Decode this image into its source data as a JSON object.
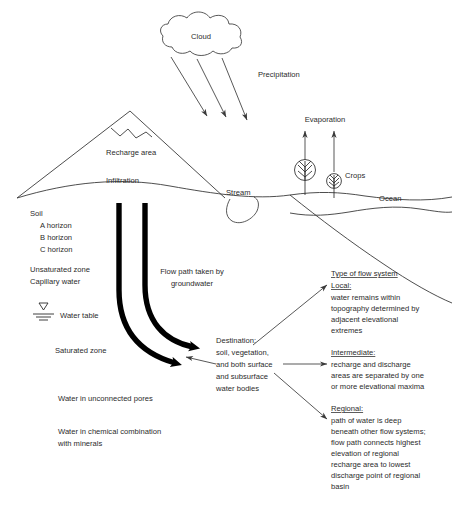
{
  "diagram": {
    "background_color": "#ffffff",
    "ink_color": "#2b2b2b",
    "flow_arrow_color": "#000000"
  },
  "labels": {
    "cloud": "Cloud",
    "precipitation": "Precipitation",
    "evaporation": "Evaporation",
    "recharge_area": "Recharge area",
    "infiltration": "Infiltration",
    "stream": "Stream",
    "crops": "Crops",
    "ocean": "Ocean",
    "water_table": "Water table",
    "saturated_zone": "Saturated zone",
    "unsaturated_zone": "Unsaturated zone",
    "capillary_water": "Capillary water",
    "soil": "Soil",
    "a_horizon": "A horizon",
    "b_horizon": "B horizon",
    "c_horizon": "C horizon",
    "unconnected_pores": "Water in unconnected pores",
    "chemical_combination_1": "Water in chemical combination",
    "chemical_combination_2": "with minerals"
  },
  "flow_path_note": {
    "line1": "Flow path taken by",
    "line2": "groundwater"
  },
  "destination": {
    "line1": "Destination:",
    "line2": "soil, vegetation,",
    "line3": "and both surface",
    "line4": "and subsurface",
    "line5": "water bodies"
  },
  "flow_systems": {
    "heading": "Type of flow system",
    "items": [
      {
        "name": "Local:",
        "lines": [
          "water remains within",
          "topography determined by",
          "adjacent elevational",
          "extremes"
        ]
      },
      {
        "name": "Intermediate:",
        "lines": [
          "recharge and discharge",
          "areas are separated by one",
          "or more elevational maxima"
        ]
      },
      {
        "name": "Regional:",
        "lines": [
          "path of water is deep",
          "beneath other flow systems;",
          "flow path connects highest",
          "elevation of regional",
          "recharge area to lowest",
          "discharge point of regional",
          "basin"
        ]
      }
    ]
  },
  "icons": {
    "cloud": "cloud-icon",
    "mountain": "mountain-icon",
    "tree": "tree-icon",
    "crop": "crop-plant-icon",
    "water_table_symbol": "water-table-icon",
    "precipitation_arrow": "precipitation-arrow-icon",
    "evaporation_arrow": "evaporation-arrow-icon",
    "flow_path_arrow": "flow-path-arrow-icon"
  }
}
